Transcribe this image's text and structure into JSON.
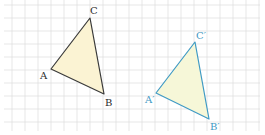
{
  "colors": {
    "grid": "#dcdcdc",
    "original_stroke": "#3a3a3a",
    "original_fill": "#fbf3d3",
    "image_stroke": "#3f9ac4",
    "image_fill": "#f6f7d8",
    "background": "#ffffff"
  },
  "grid": {
    "spacing": 13,
    "x_start": 12,
    "y_start": 5,
    "x_min": 4,
    "x_max": 260,
    "y_min": 0,
    "y_max": 131
  },
  "triangles": {
    "original": {
      "name": "ABC",
      "vertices": [
        {
          "label": "A",
          "x": 51,
          "y": 69,
          "lx": 40,
          "ly": 79
        },
        {
          "label": "B",
          "x": 104,
          "y": 94,
          "lx": 105,
          "ly": 106
        },
        {
          "label": "C",
          "x": 90,
          "y": 18,
          "lx": 90,
          "ly": 14
        }
      ]
    },
    "image": {
      "name": "A'B'C'",
      "vertices": [
        {
          "label": "A′",
          "x": 156,
          "y": 93,
          "lx": 145,
          "ly": 103
        },
        {
          "label": "B′",
          "x": 209,
          "y": 119,
          "lx": 210,
          "ly": 130
        },
        {
          "label": "C′",
          "x": 195,
          "y": 42,
          "lx": 196,
          "ly": 39
        }
      ]
    }
  },
  "transformation": {
    "type": "translation",
    "dx": 105,
    "dy": 24
  }
}
